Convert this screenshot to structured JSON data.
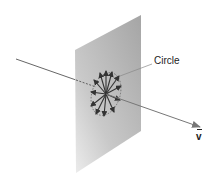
{
  "diagram": {
    "labels": {
      "circle": "Circle",
      "vector": "v"
    },
    "colors": {
      "plane_light": "#e6e6e6",
      "plane_dark": "#a9a9a9",
      "arrows": "#3a3a3a",
      "axis_line": "#555555"
    },
    "elements": {
      "plane": "gray parallelogram plane perpendicular to vector v",
      "axis": "line passing through plane along direction of v",
      "circle": "dashed ellipse in plane with radial arrows from center",
      "radial_arrow_count": 12
    }
  }
}
